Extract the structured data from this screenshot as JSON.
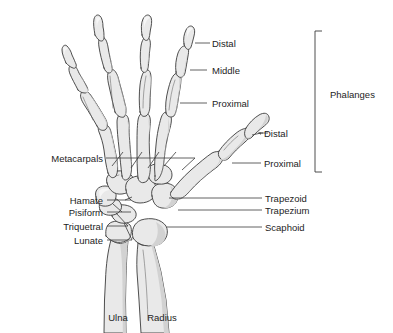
{
  "figure": {
    "background_color": "#ffffff",
    "bone_fill_color": "#e9e9e9",
    "bone_outline_color": "#3b3b3b",
    "leader_line_color": "#3a3a3a",
    "text_color": "#1d1d1d"
  },
  "labels": {
    "right_column": [
      {
        "key": "index_distal",
        "text": "Distal"
      },
      {
        "key": "index_middle",
        "text": "Middle"
      },
      {
        "key": "index_proximal",
        "text": "Proximal"
      },
      {
        "key": "thumb_distal",
        "text": "Distal"
      },
      {
        "key": "thumb_proximal",
        "text": "Proximal"
      },
      {
        "key": "trapezoid",
        "text": "Trapezoid"
      },
      {
        "key": "trapezium",
        "text": "Trapezium"
      },
      {
        "key": "scaphoid",
        "text": "Scaphoid"
      }
    ],
    "left_column": [
      {
        "key": "metacarpals",
        "text": "Metacarpals"
      },
      {
        "key": "hamate",
        "text": "Hamate"
      },
      {
        "key": "pisiform",
        "text": "Pisiform"
      },
      {
        "key": "triquetral",
        "text": "Triquetral"
      },
      {
        "key": "lunate",
        "text": "Lunate"
      }
    ],
    "bottom": [
      {
        "key": "ulna",
        "text": "Ulna"
      },
      {
        "key": "radius",
        "text": "Radius"
      }
    ],
    "bracket": {
      "key": "phalanges",
      "text": "Phalanges"
    }
  }
}
